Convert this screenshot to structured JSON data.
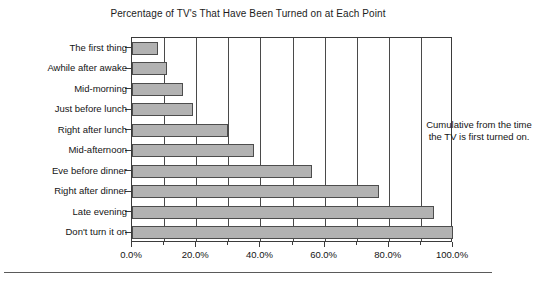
{
  "chart_data": {
    "type": "bar",
    "orientation": "horizontal",
    "title": "Percentage of TV's That Have Been Turned on at Each Point",
    "xlabel": "",
    "ylabel": "",
    "categories": [
      "The first thing",
      "Awhile after awake",
      "Mid-morning",
      "Just before lunch",
      "Right after lunch",
      "Mid-afternoon",
      "Eve before dinner",
      "Right after dinner",
      "Late evening",
      "Don't turn it on"
    ],
    "values": [
      8.0,
      11.0,
      16.0,
      19.0,
      30.0,
      38.0,
      56.0,
      77.0,
      94.0,
      100.0
    ],
    "value_labels": [
      "8.0%",
      "11.0%",
      "16.0%",
      "19.0%",
      "30.0%",
      "38.0%",
      "56.0%",
      "77.0%",
      "94.0%",
      "100.0%"
    ],
    "xlim": [
      0,
      100
    ],
    "xticks": [
      0,
      20,
      40,
      60,
      80,
      100
    ],
    "xtick_labels": [
      "0.0%",
      "20.0%",
      "40.0%",
      "60.0%",
      "80.0%",
      "100.0%"
    ],
    "minor_xticks": [
      10,
      30,
      50,
      70,
      90
    ],
    "gridlines_x": [
      10,
      20,
      30,
      40,
      50,
      60,
      70,
      80,
      90
    ],
    "grid": true,
    "legend": false,
    "annotations": [
      {
        "lines": [
          "Cumulative from the time",
          "the TV is first turned on."
        ]
      }
    ],
    "colors": {
      "bar_fill": "#b2b2b2",
      "bar_edge": "#4d4d4d",
      "axis": "#3b3b3b",
      "grid": "#4a4a4a",
      "text": "#141414",
      "background": "#ffffff"
    }
  }
}
